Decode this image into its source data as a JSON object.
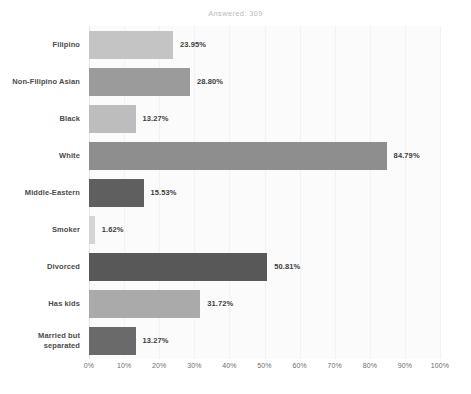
{
  "chart_data": {
    "type": "bar",
    "orientation": "horizontal",
    "title": "Answered: 309",
    "xlabel": "",
    "ylabel": "",
    "xlim": [
      0,
      100
    ],
    "grid": true,
    "legend": "none",
    "xticks": [
      "0%",
      "10%",
      "20%",
      "30%",
      "40%",
      "50%",
      "60%",
      "70%",
      "80%",
      "90%",
      "100%"
    ],
    "xtick_values": [
      0,
      10,
      20,
      30,
      40,
      50,
      60,
      70,
      80,
      90,
      100
    ],
    "categories": [
      "Filipino",
      "Non-Filipino Asian",
      "Black",
      "White",
      "Middle-Eastern",
      "Smoker",
      "Divorced",
      "Has kids",
      "Married but separated"
    ],
    "values": [
      23.95,
      28.8,
      13.27,
      84.79,
      15.53,
      1.62,
      50.81,
      31.72,
      13.27
    ],
    "data_labels": [
      "23.95%",
      "28.80%",
      "13.27%",
      "84.79%",
      "15.53%",
      "1.62%",
      "50.81%",
      "31.72%",
      "13.27%"
    ],
    "bar_colors": [
      "#c4c4c4",
      "#9b9b9b",
      "#bdbdbd",
      "#8e8e8e",
      "#5f5f5f",
      "#d5d5d5",
      "#585858",
      "#aaaaaa",
      "#6a6a6a"
    ],
    "bars": [
      {
        "label": "Filipino",
        "value": 23.95,
        "data_label": "23.95%",
        "color": "#c4c4c4"
      },
      {
        "label": "Non-Filipino Asian",
        "value": 28.8,
        "data_label": "28.80%",
        "color": "#9b9b9b"
      },
      {
        "label": "Black",
        "value": 13.27,
        "data_label": "13.27%",
        "color": "#bdbdbd"
      },
      {
        "label": "White",
        "value": 84.79,
        "data_label": "84.79%",
        "color": "#8e8e8e"
      },
      {
        "label": "Middle-Eastern",
        "value": 15.53,
        "data_label": "15.53%",
        "color": "#5f5f5f"
      },
      {
        "label": "Smoker",
        "value": 1.62,
        "data_label": "1.62%",
        "color": "#d5d5d5"
      },
      {
        "label": "Divorced",
        "value": 50.81,
        "data_label": "50.81%",
        "color": "#585858"
      },
      {
        "label": "Has kids",
        "value": 31.72,
        "data_label": "31.72%",
        "color": "#aaaaaa"
      },
      {
        "label": "Married but separated",
        "value": 13.27,
        "data_label": "13.27%",
        "color": "#6a6a6a"
      }
    ]
  },
  "style": {
    "plot_background": "#fbfbfb",
    "grid_color": "#f2f2f2",
    "axis_color": "#e6e6e6",
    "title_color": "#b9b9b9",
    "label_color": "#4b4b4b",
    "value_color": "#3d3d3d",
    "tick_color": "#6e6e6e"
  }
}
